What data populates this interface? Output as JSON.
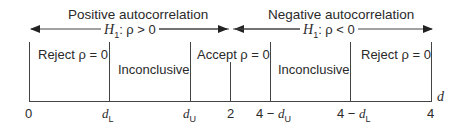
{
  "diagram": {
    "headers": {
      "positive": "Positive autocorrelation",
      "negative": "Negative autocorrelation"
    },
    "hypotheses": {
      "positive": {
        "h": "H",
        "sub": "1",
        "rest": ":  ρ > 0"
      },
      "negative": {
        "h": "H",
        "sub": "1",
        "rest": ":  ρ < 0"
      }
    },
    "regions": [
      {
        "label": "Reject ρ = 0"
      },
      {
        "label": "Inconclusive"
      },
      {
        "label": "Accept ρ = 0"
      },
      {
        "label": "Inconclusive"
      },
      {
        "label": "Reject ρ = 0"
      }
    ],
    "ticks": [
      {
        "label": "0"
      },
      {
        "main": "d",
        "sub": "L"
      },
      {
        "main": "d",
        "sub": "U"
      },
      {
        "label": "2"
      },
      {
        "prefix": "4 − ",
        "main": "d",
        "sub": "U"
      },
      {
        "prefix": "4 − ",
        "main": "d",
        "sub": "L"
      },
      {
        "label": "4"
      }
    ],
    "axis_label": "d",
    "colors": {
      "line": "#3a3a3a",
      "text": "#2a2a2a"
    }
  }
}
